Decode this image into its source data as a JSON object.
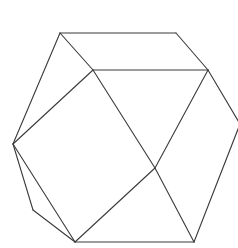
{
  "diagram": {
    "type": "polyhedron-line-drawing",
    "stroke_color": "#3a3a3a",
    "background": "#ffffff",
    "vertices": {
      "A": [
        60,
        33
      ],
      "B": [
        176,
        33
      ],
      "C": [
        93,
        70
      ],
      "D": [
        208,
        70
      ],
      "E": [
        13,
        144
      ],
      "F": [
        240,
        124
      ],
      "G": [
        155,
        168
      ],
      "H": [
        33,
        210
      ],
      "I": [
        75,
        242
      ],
      "J": [
        194,
        242
      ]
    },
    "edges": [
      [
        "A",
        "B"
      ],
      [
        "B",
        "D"
      ],
      [
        "A",
        "C"
      ],
      [
        "C",
        "D"
      ],
      [
        "A",
        "E"
      ],
      [
        "E",
        "C"
      ],
      [
        "C",
        "G"
      ],
      [
        "D",
        "G"
      ],
      [
        "D",
        "F"
      ],
      [
        "F",
        "J"
      ],
      [
        "G",
        "I"
      ],
      [
        "G",
        "J"
      ],
      [
        "E",
        "H"
      ],
      [
        "H",
        "I"
      ],
      [
        "E",
        "I"
      ],
      [
        "I",
        "J"
      ]
    ]
  }
}
